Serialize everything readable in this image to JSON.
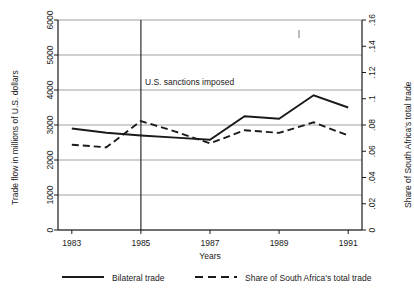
{
  "chart_data": {
    "type": "line",
    "title": "",
    "xlabel": "Years",
    "x": [
      1983,
      1984,
      1985,
      1986,
      1987,
      1988,
      1989,
      1990,
      1991
    ],
    "xticks": [
      "1983",
      "1985",
      "1987",
      "1989",
      "1991"
    ],
    "xtick_values": [
      1983,
      1985,
      1987,
      1989,
      1991
    ],
    "xlim": [
      1982.6,
      1991.4
    ],
    "grid": true,
    "legend_position": "bottom",
    "axes": [
      {
        "id": "left",
        "ylabel": "Trade flow in millions of U.S. dollars",
        "ylim": [
          0,
          6000
        ],
        "yticks": [
          0,
          1000,
          2000,
          3000,
          4000,
          5000,
          6000
        ],
        "ytick_labels": [
          "0",
          "1000",
          "2000",
          "3000",
          "4000",
          "5000",
          "6000"
        ]
      },
      {
        "id": "right",
        "ylabel": "Share of South Africa's total trade",
        "ylim": [
          0,
          0.16
        ],
        "yticks": [
          0,
          0.02,
          0.04,
          0.06,
          0.08,
          0.1,
          0.12,
          0.14,
          0.16
        ],
        "ytick_labels": [
          "0",
          ".02",
          ".04",
          ".06",
          ".08",
          ".1",
          ".12",
          ".14",
          ".16"
        ]
      }
    ],
    "series": [
      {
        "name": "Bilateral trade",
        "axis": "left",
        "style": "solid",
        "color": "#1a1a1a",
        "values": [
          2900,
          2780,
          2700,
          2640,
          2580,
          3250,
          3180,
          3850,
          3500
        ]
      },
      {
        "name": "Share of South Africa's total trade",
        "axis": "right",
        "style": "dashed",
        "color": "#1a1a1a",
        "values": [
          0.065,
          0.063,
          0.083,
          0.075,
          0.066,
          0.076,
          0.074,
          0.082,
          0.072
        ]
      }
    ],
    "annotations": [
      {
        "text": "U.S. sanctions imposed",
        "x": 1985,
        "type": "vline-label",
        "vline_x": 1985
      }
    ]
  },
  "legend": {
    "items": [
      {
        "label": "Bilateral trade",
        "style": "solid"
      },
      {
        "label": "Share of South Africa's total trade",
        "style": "dashed"
      }
    ]
  }
}
